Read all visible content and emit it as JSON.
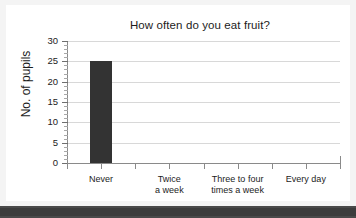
{
  "chart_data": {
    "type": "bar",
    "title": "How often do you eat fruit?",
    "xlabel": "",
    "ylabel": "No. of pupils",
    "categories": [
      "Never",
      "Twice a week",
      "Three to four times a week",
      "Every day"
    ],
    "category_lines": [
      [
        "Never"
      ],
      [
        "Twice",
        "a week"
      ],
      [
        "Three to four",
        "times a week"
      ],
      [
        "Every day"
      ]
    ],
    "values": [
      25,
      0,
      0,
      0
    ],
    "ylim": [
      0,
      30
    ],
    "ytick_labels": [
      "0",
      "5",
      "10",
      "15",
      "20",
      "25",
      "30"
    ],
    "ytick_values": [
      0,
      5,
      10,
      15,
      20,
      25,
      30
    ],
    "minor_tick_step": 1,
    "grid": "horizontal",
    "legend": "none",
    "bar_color": "#333333",
    "gridline_color": "#d8d8d8",
    "axis_color": "#8a8a8a",
    "text_color": "#1c1c1c",
    "background_color": "#ffffff"
  }
}
